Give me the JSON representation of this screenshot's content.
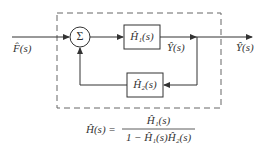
{
  "diagram": {
    "type": "block-diagram-feedback-loop",
    "input_label": "F̂(s)",
    "output_label_inner": "Ŷ(s)",
    "output_label_outer": "Ŷ(s)",
    "summing_junction_symbol": "Σ",
    "blocks": [
      {
        "id": "H1",
        "label": "Ĥ₁(s)",
        "path": "forward"
      },
      {
        "id": "H2",
        "label": "Ĥ₂(s)",
        "path": "feedback"
      }
    ],
    "boundary": "dashed",
    "colors": {
      "line": "#333333",
      "dash": "#666666",
      "background": "#ffffff"
    }
  },
  "formula": {
    "lhs": "Ĥ(s) =",
    "numerator": "Ĥ₁(s)",
    "denominator": "1 − Ĥ₁(s)Ĥ₂(s)"
  }
}
